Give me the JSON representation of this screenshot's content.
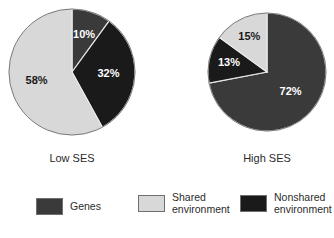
{
  "chart_data": {
    "type": "pie",
    "title": "",
    "subtitle": "",
    "legend_position": "bottom",
    "grid": false,
    "categories": [
      "Genes",
      "Shared environment",
      "Nonshared environment"
    ],
    "colors": {
      "genes": "#3a3a3a",
      "shared_environment": "#d8d8d8",
      "nonshared_environment": "#1a1a1a",
      "background": "#ffffff",
      "slice_border": "#e8e8e8",
      "pie_outline": "#7a7a7a",
      "label_on_dark": "#ffffff",
      "label_on_light": "#1a1a1a"
    },
    "charts": [
      {
        "name": "low-ses",
        "caption": "Low SES",
        "slices": [
          {
            "category": "Genes",
            "value": 10,
            "label": "10%",
            "color_key": "genes",
            "on_light": false
          },
          {
            "category": "Nonshared environment",
            "value": 32,
            "label": "32%",
            "color_key": "nonshared_environment",
            "on_light": false
          },
          {
            "category": "Shared environment",
            "value": 58,
            "label": "58%",
            "color_key": "shared_environment",
            "on_light": true
          }
        ]
      },
      {
        "name": "high-ses",
        "caption": "High SES",
        "slices": [
          {
            "category": "Genes",
            "value": 72,
            "label": "72%",
            "color_key": "genes",
            "on_light": false
          },
          {
            "category": "Nonshared environment",
            "value": 13,
            "label": "13%",
            "color_key": "nonshared_environment",
            "on_light": false
          },
          {
            "category": "Shared environment",
            "value": 15,
            "label": "15%",
            "color_key": "shared_environment",
            "on_light": true
          }
        ]
      }
    ]
  },
  "pies": {
    "low": {
      "caption": "Low SES",
      "center_x": 64,
      "center_y": 64,
      "radius": 63,
      "start_angle": 0,
      "label_10": "10%",
      "label_32": "32%",
      "label_58": "58%"
    },
    "high": {
      "caption": "High SES",
      "center_x": 60,
      "center_y": 60,
      "radius": 59,
      "start_angle": 0,
      "label_72": "72%",
      "label_13": "13%",
      "label_15": "15%"
    }
  },
  "legend": {
    "items": [
      {
        "label": "Genes",
        "color_key": "genes"
      },
      {
        "label": "Shared\nenvironment",
        "color_key": "shared_environment"
      },
      {
        "label": "Nonshared\nenvironment",
        "color_key": "nonshared_environment"
      }
    ]
  }
}
